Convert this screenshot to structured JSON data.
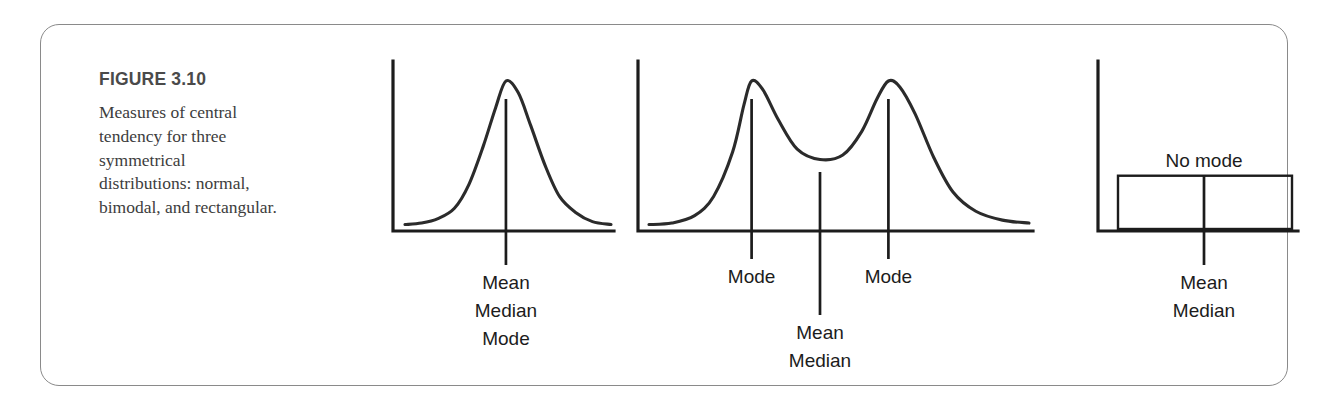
{
  "figure": {
    "number_label": "FIGURE 3.10",
    "caption": "Measures of central tendency for three symmetrical distributions: normal, bimodal, and rectangular.",
    "border_color": "#8a8a8a",
    "ink_color": "#1c1c1c",
    "heading_color": "#4a4a4a"
  },
  "chart_data": [
    {
      "type": "line",
      "name": "normal-distribution",
      "title": "",
      "xlabel": "",
      "ylabel": "",
      "grid": false,
      "legend": "none",
      "description": "Symmetrical normal (bell) curve with a single central vertical line.",
      "markers": [
        {
          "id": "center",
          "x_fraction": 0.49,
          "labels": [
            "Mean",
            "Median",
            "Mode"
          ]
        }
      ],
      "curve_points": [
        {
          "x": 0.0,
          "y": 0.03
        },
        {
          "x": 0.08,
          "y": 0.04
        },
        {
          "x": 0.16,
          "y": 0.07
        },
        {
          "x": 0.24,
          "y": 0.14
        },
        {
          "x": 0.31,
          "y": 0.3
        },
        {
          "x": 0.38,
          "y": 0.56
        },
        {
          "x": 0.44,
          "y": 0.82
        },
        {
          "x": 0.49,
          "y": 1.0
        },
        {
          "x": 0.55,
          "y": 0.92
        },
        {
          "x": 0.61,
          "y": 0.7
        },
        {
          "x": 0.68,
          "y": 0.43
        },
        {
          "x": 0.75,
          "y": 0.22
        },
        {
          "x": 0.83,
          "y": 0.11
        },
        {
          "x": 0.91,
          "y": 0.05
        },
        {
          "x": 1.0,
          "y": 0.03
        }
      ]
    },
    {
      "type": "line",
      "name": "bimodal-distribution",
      "title": "",
      "xlabel": "",
      "ylabel": "",
      "grid": false,
      "legend": "none",
      "description": "Symmetrical bimodal curve with two equal peaks and a central valley.",
      "markers": [
        {
          "id": "left-peak",
          "x_fraction": 0.27,
          "labels": [
            "Mode"
          ]
        },
        {
          "id": "center",
          "x_fraction": 0.45,
          "labels": [
            "Mean",
            "Median"
          ]
        },
        {
          "id": "right-peak",
          "x_fraction": 0.63,
          "labels": [
            "Mode"
          ]
        }
      ],
      "curve_points": [
        {
          "x": 0.0,
          "y": 0.03
        },
        {
          "x": 0.06,
          "y": 0.04
        },
        {
          "x": 0.12,
          "y": 0.09
        },
        {
          "x": 0.17,
          "y": 0.22
        },
        {
          "x": 0.22,
          "y": 0.52
        },
        {
          "x": 0.25,
          "y": 0.84
        },
        {
          "x": 0.27,
          "y": 1.0
        },
        {
          "x": 0.3,
          "y": 0.94
        },
        {
          "x": 0.34,
          "y": 0.74
        },
        {
          "x": 0.39,
          "y": 0.54
        },
        {
          "x": 0.45,
          "y": 0.47
        },
        {
          "x": 0.51,
          "y": 0.5
        },
        {
          "x": 0.56,
          "y": 0.66
        },
        {
          "x": 0.6,
          "y": 0.88
        },
        {
          "x": 0.63,
          "y": 1.0
        },
        {
          "x": 0.66,
          "y": 0.96
        },
        {
          "x": 0.7,
          "y": 0.78
        },
        {
          "x": 0.75,
          "y": 0.48
        },
        {
          "x": 0.8,
          "y": 0.25
        },
        {
          "x": 0.86,
          "y": 0.12
        },
        {
          "x": 0.93,
          "y": 0.06
        },
        {
          "x": 1.0,
          "y": 0.04
        }
      ]
    },
    {
      "type": "bar",
      "name": "rectangular-distribution",
      "title": "",
      "xlabel": "",
      "ylabel": "",
      "grid": false,
      "legend": "none",
      "description": "Rectangular (uniform) distribution drawn as one flat box with a central vertical line.",
      "annotation": "No mode",
      "box": {
        "x_start_fraction": 0.1,
        "x_end_fraction": 0.97,
        "height_fraction": 0.36
      },
      "markers": [
        {
          "id": "center",
          "x_fraction": 0.53,
          "labels": [
            "Mean",
            "Median"
          ]
        }
      ]
    }
  ]
}
